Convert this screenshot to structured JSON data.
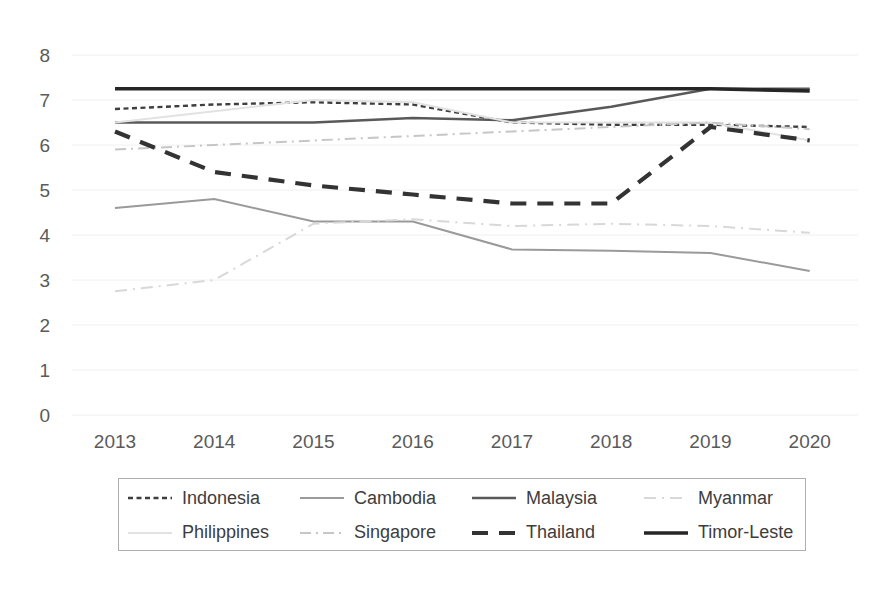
{
  "chart_data": {
    "type": "line",
    "title": "",
    "subtitle": "",
    "xlabel": "",
    "ylabel": "",
    "categories": [
      "2013",
      "2014",
      "2015",
      "2016",
      "2017",
      "2018",
      "2019",
      "2020"
    ],
    "x": [
      2013,
      2014,
      2015,
      2016,
      2017,
      2018,
      2019,
      2020
    ],
    "ylim": [
      0,
      8
    ],
    "yticks": [
      0,
      1,
      2,
      3,
      4,
      5,
      6,
      7,
      8
    ],
    "ytick_labels": [
      "0",
      "1",
      "2",
      "3",
      "4",
      "5",
      "6",
      "7",
      "8"
    ],
    "grid": true,
    "grid_axis": "y",
    "legend_position": "bottom",
    "legend_columns": 4,
    "series": [
      {
        "name": "Indonesia",
        "values": [
          6.8,
          6.9,
          6.95,
          6.9,
          6.5,
          6.45,
          6.45,
          6.4
        ],
        "color": "#3f3f3f",
        "style": "dotted",
        "width": 2.4
      },
      {
        "name": "Cambodia",
        "values": [
          4.6,
          4.8,
          4.3,
          4.3,
          3.68,
          3.65,
          3.6,
          3.2
        ],
        "color": "#9a9a9a",
        "style": "solid",
        "width": 2.0
      },
      {
        "name": "Malaysia",
        "values": [
          6.5,
          6.5,
          6.5,
          6.6,
          6.55,
          6.85,
          7.25,
          7.25
        ],
        "color": "#595959",
        "style": "solid",
        "width": 2.6
      },
      {
        "name": "Myanmar",
        "values": [
          2.75,
          3.0,
          4.25,
          4.35,
          4.2,
          4.25,
          4.2,
          4.05
        ],
        "color": "#d8d8d8",
        "style": "dashdot-light",
        "width": 2.0
      },
      {
        "name": "Philippines",
        "values": [
          6.5,
          6.75,
          7.0,
          6.95,
          6.5,
          6.5,
          6.5,
          6.1
        ],
        "color": "#e2e2e2",
        "style": "solid",
        "width": 2.0
      },
      {
        "name": "Singapore",
        "values": [
          5.9,
          6.0,
          6.1,
          6.2,
          6.3,
          6.4,
          6.5,
          6.35
        ],
        "color": "#c6c6c6",
        "style": "dashdot",
        "width": 2.0
      },
      {
        "name": "Thailand",
        "values": [
          6.3,
          5.4,
          5.1,
          4.9,
          4.7,
          4.7,
          6.4,
          6.1
        ],
        "color": "#333333",
        "style": "dashed",
        "width": 4.2
      },
      {
        "name": "Timor-Leste",
        "values": [
          7.25,
          7.25,
          7.25,
          7.25,
          7.25,
          7.25,
          7.25,
          7.2
        ],
        "color": "#262626",
        "style": "solid",
        "width": 3.6
      }
    ]
  },
  "legend": {
    "items": [
      {
        "label": "Indonesia"
      },
      {
        "label": "Cambodia"
      },
      {
        "label": "Malaysia"
      },
      {
        "label": "Myanmar"
      },
      {
        "label": "Philippines"
      },
      {
        "label": "Singapore"
      },
      {
        "label": "Thailand"
      },
      {
        "label": "Timor-Leste"
      }
    ]
  }
}
